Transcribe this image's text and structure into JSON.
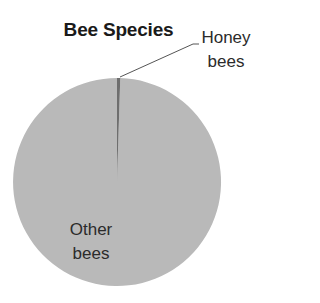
{
  "chart_data": {
    "type": "pie",
    "title": "Bee Species",
    "categories": [
      "Honey bees",
      "Other bees"
    ],
    "values": [
      0.5,
      99.5
    ],
    "unit": "percent (estimated from slice angle)",
    "colors": [
      "#6e6e6e",
      "#b9b9b9"
    ],
    "labels": [
      {
        "line1": "Honey",
        "line2": "bees"
      },
      {
        "line1": "Other",
        "line2": "bees"
      }
    ],
    "legend": "none (data labels with leader line)",
    "start_angle": "12 o'clock, clockwise"
  },
  "colors": {
    "background": "#ffffff",
    "honey_slice": "#6e6e6e",
    "other_slice": "#b9b9b9",
    "leader_line": "#555555",
    "text": "#2b2b2b"
  }
}
